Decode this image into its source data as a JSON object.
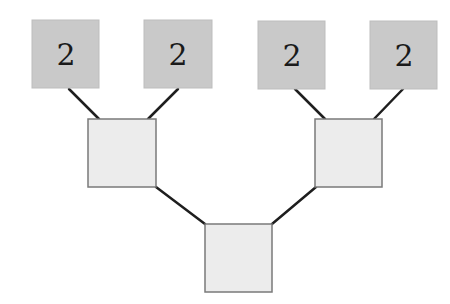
{
  "diagram": {
    "type": "binary-tree",
    "colors": {
      "leaf_fill": "#c9c9c9",
      "node_fill": "#ececec",
      "node_border": "#7a7a7a",
      "edge": "#1e1e1e"
    },
    "leaves": [
      {
        "label": "2",
        "x": 32,
        "y": 20,
        "w": 67,
        "h": 68
      },
      {
        "label": "2",
        "x": 144,
        "y": 20,
        "w": 68,
        "h": 68
      },
      {
        "label": "2",
        "x": 258,
        "y": 21,
        "w": 67,
        "h": 68
      },
      {
        "label": "2",
        "x": 370,
        "y": 21,
        "w": 67,
        "h": 68
      }
    ],
    "internal_nodes": [
      {
        "label": "",
        "x": 88,
        "y": 119,
        "w": 68,
        "h": 68
      },
      {
        "label": "",
        "x": 315,
        "y": 119,
        "w": 67,
        "h": 68
      }
    ],
    "root": {
      "label": "",
      "x": 205,
      "y": 224,
      "w": 67,
      "h": 68
    },
    "edges": [
      {
        "from": "leaf-1",
        "to": "internal-left",
        "x1": 69,
        "y1": 89,
        "x2": 99,
        "y2": 119
      },
      {
        "from": "leaf-2",
        "to": "internal-left",
        "x1": 178,
        "y1": 89,
        "x2": 148,
        "y2": 119
      },
      {
        "from": "leaf-3",
        "to": "internal-right",
        "x1": 295,
        "y1": 89,
        "x2": 325,
        "y2": 119
      },
      {
        "from": "leaf-4",
        "to": "internal-right",
        "x1": 403,
        "y1": 89,
        "x2": 374,
        "y2": 119
      },
      {
        "from": "internal-left",
        "to": "root",
        "x1": 156,
        "y1": 187,
        "x2": 205,
        "y2": 224
      },
      {
        "from": "internal-right",
        "to": "root",
        "x1": 316,
        "y1": 187,
        "x2": 272,
        "y2": 224
      }
    ]
  }
}
